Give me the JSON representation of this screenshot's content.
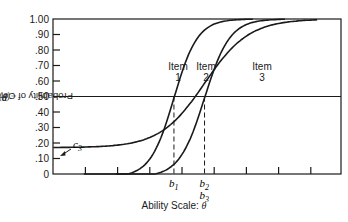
{
  "chart_data": {
    "type": "line",
    "title": "",
    "xlabel": "Ability Scale: θ",
    "ylabel": "Probability of Correct Response: P_i(θ)",
    "ylabel_prefix": "Probability of Correct Response: ",
    "ylabel_symbol": "P",
    "ylabel_sub": "i",
    "ylabel_arg": "(θ)",
    "ylim": [
      0,
      1.0
    ],
    "yticks": [
      "0",
      ".10",
      ".20",
      ".30",
      ".40",
      ".50",
      ".60",
      ".70",
      ".80",
      ".90",
      "1.00"
    ],
    "ytick_values": [
      0,
      0.1,
      0.2,
      0.3,
      0.4,
      0.5,
      0.6,
      0.7,
      0.8,
      0.9,
      1.0
    ],
    "xticks_unlabeled_count": 8,
    "grid": false,
    "reference_line": {
      "y": 0.5
    },
    "series": [
      {
        "name": "Item 1",
        "label_line1": "Item",
        "label_line2": "1",
        "a": 1.6,
        "b": -0.25,
        "c": 0.0
      },
      {
        "name": "Item 2",
        "label_line1": "Item",
        "label_line2": "2",
        "a": 1.5,
        "b": 0.7,
        "c": 0.0
      },
      {
        "name": "Item 3",
        "label_line1": "Item",
        "label_line2": "3",
        "a": 0.85,
        "b": 0.7,
        "c": 0.17
      }
    ],
    "annotations": [
      {
        "text": "c3",
        "base": "c",
        "sub": "3",
        "meaning": "lower asymptote of Item 3 (≈ .17)"
      },
      {
        "text": "b1",
        "base": "b",
        "sub": "1",
        "meaning": "difficulty of Item 1 where P = .50"
      },
      {
        "text": "b2",
        "base": "b",
        "sub": "2",
        "meaning": "difficulty of Item 2"
      },
      {
        "text": "b3",
        "base": "b",
        "sub": "3",
        "meaning": "difficulty of Item 3 (same θ as b2)"
      }
    ]
  },
  "labels": {
    "xlabel_text": "Ability Scale:  ",
    "xlabel_symbol": "θ"
  }
}
